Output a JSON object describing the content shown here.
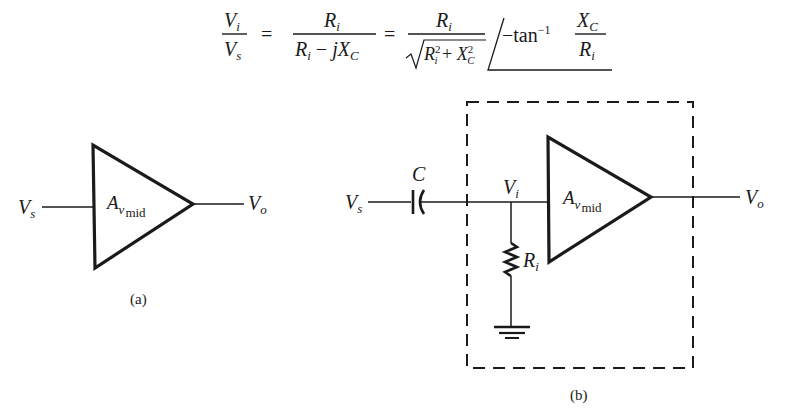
{
  "equation": {
    "lhs_num": "V",
    "lhs_num_sub": "i",
    "lhs_den": "V",
    "lhs_den_sub": "s",
    "eq1": "=",
    "f1_num": "R",
    "f1_num_sub": "i",
    "f1_den_a": "R",
    "f1_den_a_sub": "i",
    "f1_den_op": "−",
    "f1_den_b": "jX",
    "f1_den_b_sub": "C",
    "eq2": "=",
    "f2_num": "R",
    "f2_num_sub": "i",
    "f2_den_a": "R",
    "f2_den_a_sub": "i",
    "f2_den_a_sup": "2",
    "f2_den_op": "+",
    "f2_den_b": "X",
    "f2_den_b_sub": "C",
    "f2_den_b_sup": "2",
    "angle_prefix": "−tan",
    "angle_exp": "−1",
    "f3_num": "X",
    "f3_num_sub": "C",
    "f3_den": "R",
    "f3_den_sub": "i"
  },
  "diagram_a": {
    "input_label": "V",
    "input_sub": "s",
    "output_label": "V",
    "output_sub": "o",
    "gain_label": "A",
    "gain_sub1": "v",
    "gain_sub2": "mid",
    "caption": "(a)"
  },
  "diagram_b": {
    "input_label": "V",
    "input_sub": "s",
    "capacitor_label": "C",
    "node_label": "V",
    "node_sub": "i",
    "resistor_label": "R",
    "resistor_sub": "i",
    "gain_label": "A",
    "gain_sub1": "v",
    "gain_sub2": "mid",
    "output_label": "V",
    "output_sub": "o",
    "caption": "(b)"
  }
}
